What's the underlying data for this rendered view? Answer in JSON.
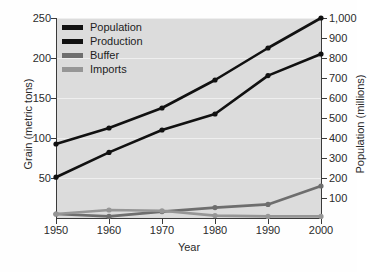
{
  "chart_data": {
    "type": "line",
    "title": "",
    "xlabel": "Year",
    "ylabel": "Grain (metric tons)",
    "y2label": "Population (millions)",
    "x": [
      1950,
      1960,
      1970,
      1980,
      1990,
      2000
    ],
    "xticklabels": [
      "1950",
      "1960",
      "1970",
      "1980",
      "1990",
      "2000"
    ],
    "xlim": [
      1950,
      2000
    ],
    "ylim": [
      0,
      250
    ],
    "yticks": [
      50,
      100,
      150,
      200,
      250
    ],
    "yticklabels": [
      "50",
      "100",
      "150",
      "200",
      "250"
    ],
    "y2lim": [
      0,
      1000
    ],
    "y2ticks": [
      100,
      200,
      300,
      400,
      500,
      600,
      700,
      800,
      900,
      1000
    ],
    "y2ticklabels": [
      "100",
      "200",
      "300",
      "400",
      "500",
      "600",
      "700",
      "800",
      "900",
      "1,000"
    ],
    "grid": true,
    "legend_position": "top-left",
    "series": [
      {
        "name": "Population",
        "axis": "right",
        "units": "millions",
        "color": "#111111",
        "values": [
          370,
          450,
          550,
          690,
          850,
          1000
        ]
      },
      {
        "name": "Production",
        "axis": "left",
        "units": "metric tons",
        "color": "#111111",
        "values": [
          51,
          82,
          110,
          130,
          178,
          205
        ]
      },
      {
        "name": "Buffer",
        "axis": "left",
        "units": "metric tons",
        "color": "#6e6e6e",
        "values": [
          5,
          2,
          8,
          13,
          17,
          40
        ]
      },
      {
        "name": "Imports",
        "axis": "left",
        "units": "metric tons",
        "color": "#969696",
        "values": [
          5,
          10,
          9,
          3,
          2,
          2
        ]
      }
    ]
  },
  "legend": {
    "items": [
      {
        "label": "Population",
        "color": "#111111"
      },
      {
        "label": "Production",
        "color": "#111111"
      },
      {
        "label": "Buffer",
        "color": "#6e6e6e"
      },
      {
        "label": "Imports",
        "color": "#969696"
      }
    ]
  },
  "colors": {
    "plot_background": "#dcdcdc",
    "gridline": "#efefef",
    "axis": "#3a3a3a",
    "text": "#2b2b2b"
  }
}
